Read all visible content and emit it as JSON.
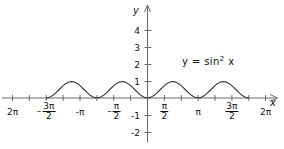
{
  "chart_data": {
    "type": "line",
    "title": "",
    "equation_label": "y = sin",
    "equation_exponent": "2",
    "equation_tail": "x",
    "function": "y = sin^2 x",
    "xlabel": "x",
    "ylabel": "y",
    "xlim": [
      -6.2831853,
      6.2831853
    ],
    "ylim": [
      -2.0,
      4.7
    ],
    "grid": false,
    "legend": "none",
    "line_color": "#333333",
    "axis_color": "#555555",
    "x_ticks": [
      {
        "value": -6.2831853,
        "label": "2π",
        "sign": "",
        "type": "plain"
      },
      {
        "value": -4.712389,
        "label": "3π/2",
        "sign": "–",
        "type": "fraction",
        "num": "3π",
        "den": "2"
      },
      {
        "value": -3.1415927,
        "label": "-π",
        "sign": "",
        "type": "plain"
      },
      {
        "value": -1.5707963,
        "label": "π/2",
        "sign": "–",
        "type": "fraction",
        "num": "π",
        "den": "2"
      },
      {
        "value": 1.5707963,
        "label": "π/2",
        "sign": "",
        "type": "fraction",
        "num": "π",
        "den": "2"
      },
      {
        "value": 3.1415927,
        "label": "π",
        "sign": "",
        "type": "plain"
      },
      {
        "value": 4.712389,
        "label": "3π/2",
        "sign": "",
        "type": "fraction",
        "num": "3π",
        "den": "2"
      },
      {
        "value": 6.2831853,
        "label": "2π",
        "sign": "",
        "type": "plain"
      }
    ],
    "x_minor_ticks": [
      -5.4977871,
      -3.9269908,
      -2.3561945,
      -0.7853982,
      0.7853982,
      2.3561945,
      3.9269908,
      5.4977871
    ],
    "y_ticks": [
      {
        "value": 4,
        "label": "4"
      },
      {
        "value": 3,
        "label": "3"
      },
      {
        "value": 2,
        "label": "2"
      },
      {
        "value": 1,
        "label": "1"
      },
      {
        "value": -1,
        "label": "-1"
      },
      {
        "value": -2,
        "label": "-2"
      }
    ],
    "zeros": [
      -6.2831853,
      -3.1415927,
      0,
      3.1415927,
      6.2831853
    ],
    "maxima": [
      {
        "x": -4.712389,
        "y": 1
      },
      {
        "x": -1.5707963,
        "y": 1
      },
      {
        "x": 1.5707963,
        "y": 1
      },
      {
        "x": 4.712389,
        "y": 1
      }
    ],
    "series": [
      {
        "name": "y = sin^2 x",
        "color": "#333333",
        "points_x": [
          -6.2831853,
          -6.0868351,
          -5.890485,
          -5.6941348,
          -5.4977871,
          -5.3014369,
          -5.1050868,
          -4.9087366,
          -4.712389,
          -4.5160388,
          -4.3196887,
          -4.1233385,
          -3.9269908,
          -3.7306406,
          -3.5342905,
          -3.3379403,
          -3.1415927,
          -2.9452424,
          -2.7488923,
          -2.5525441,
          -2.3561945,
          -2.1598443,
          -1.9634942,
          -1.767146,
          -1.5707963,
          -1.3744467,
          -1.1780985,
          -0.9817484,
          -0.7853982,
          -0.589048,
          -0.3926999,
          -0.1963497,
          0,
          0.1963497,
          0.3926999,
          0.589048,
          0.7853982,
          0.9817484,
          1.1780985,
          1.3744467,
          1.5707963,
          1.767146,
          1.9634942,
          2.1598443,
          2.3561945,
          2.5525441,
          2.7488923,
          2.9452424,
          3.1415927,
          3.3379403,
          3.5342905,
          3.7306406,
          3.9269908,
          4.1233385,
          4.3196887,
          4.5160388,
          4.712389,
          4.9087366,
          5.1050868,
          5.3014369,
          5.4977871,
          5.6941348,
          5.890485,
          6.0868351,
          6.2831853
        ],
        "points_y": [
          0,
          0.0381,
          0.1464,
          0.3087,
          0.5,
          0.6913,
          0.8536,
          0.9619,
          1,
          0.9619,
          0.8536,
          0.6913,
          0.5,
          0.3087,
          0.1464,
          0.0381,
          0,
          0.0381,
          0.1464,
          0.3087,
          0.5,
          0.6913,
          0.8536,
          0.9619,
          1,
          0.9619,
          0.8536,
          0.6913,
          0.5,
          0.3087,
          0.1464,
          0.0381,
          0,
          0.0381,
          0.1464,
          0.3087,
          0.5,
          0.6913,
          0.8536,
          0.9619,
          1,
          0.9619,
          0.8536,
          0.6913,
          0.5,
          0.3087,
          0.1464,
          0.0381,
          0,
          0.0381,
          0.1464,
          0.3087,
          0.5,
          0.6913,
          0.8536,
          0.9619,
          1,
          0.9619,
          0.8536,
          0.6913,
          0.5,
          0.3087,
          0.1464,
          0.0381,
          0
        ]
      }
    ]
  },
  "axes": {
    "x_axis_name": "x",
    "y_axis_name": "y"
  }
}
